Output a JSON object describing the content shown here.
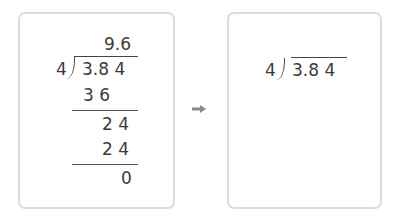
{
  "worked_example": {
    "quotient": "9.6",
    "divisor": "4",
    "dividend": "3.8 4",
    "steps": [
      {
        "value": "3 6"
      },
      {
        "value": "2 4"
      },
      {
        "value": "2 4"
      },
      {
        "value": "0"
      }
    ]
  },
  "arrow": {
    "icon": "right-arrow-icon",
    "color": "#8a8a8a"
  },
  "exercise": {
    "divisor": "4",
    "dividend": "3.8 4"
  },
  "colors": {
    "card_border": "#dcdcdc",
    "text": "#3a3a3a"
  }
}
